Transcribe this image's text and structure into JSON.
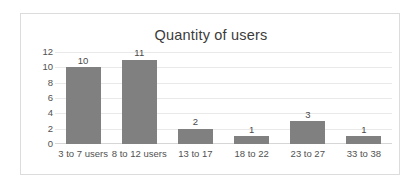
{
  "chart_data": {
    "type": "bar",
    "title": "Quantity of users",
    "xlabel": "",
    "ylabel": "",
    "categories": [
      "3 to 7 users",
      "8 to 12 users",
      "13 to 17",
      "18 to 22",
      "23 to 27",
      "33 to 38"
    ],
    "values": [
      10,
      11,
      2,
      1,
      3,
      1
    ],
    "data_labels": [
      "10",
      "11",
      "2",
      "1",
      "3",
      "1"
    ],
    "ylim": [
      0,
      12
    ],
    "ytick_labels": [
      "12",
      "10",
      "8",
      "6",
      "4",
      "2",
      "0"
    ],
    "ytick_values": [
      12,
      10,
      8,
      6,
      4,
      2,
      0
    ],
    "grid": "horizontal",
    "legend": "none",
    "bar_color": "#808080",
    "gridline_color": "#e9e9e9",
    "text_color": "#515151",
    "title_color": "#3b3b3b",
    "plot_background": "#ffffff",
    "border_color": "#dcdcdc"
  }
}
